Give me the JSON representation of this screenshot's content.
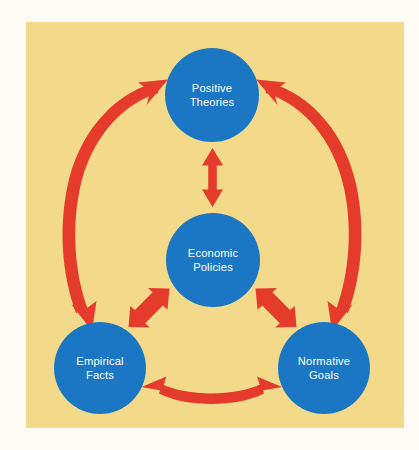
{
  "canvas": {
    "width": 419,
    "height": 450,
    "page_background": "#fdfbf3"
  },
  "panel": {
    "name": "yellow-board",
    "x": 26,
    "y": 22,
    "width": 378,
    "height": 406,
    "color": "#f3da8a"
  },
  "palette": {
    "node_fill": "#1b76c4",
    "node_text": "#ffffff",
    "arrow_fill": "#e53b2c",
    "panel_fill": "#f3da8a",
    "page_fill": "#fdfbf3"
  },
  "diagram": {
    "type": "cycle-diagram",
    "title": "",
    "nodes": [
      {
        "id": "positive-theories",
        "label_line1": "Positive",
        "label_line2": "Theories",
        "cx": 212,
        "cy": 95,
        "r": 47,
        "position": "top"
      },
      {
        "id": "economic-policies",
        "label_line1": "Economic",
        "label_line2": "Policies",
        "cx": 213,
        "cy": 260,
        "r": 47,
        "position": "center"
      },
      {
        "id": "empirical-facts",
        "label_line1": "Empirical",
        "label_line2": "Facts",
        "cx": 100,
        "cy": 368,
        "r": 46,
        "position": "bottom-left"
      },
      {
        "id": "normative-goals",
        "label_line1": "Normative",
        "label_line2": "Goals",
        "cx": 324,
        "cy": 368,
        "r": 46,
        "position": "bottom-right"
      }
    ],
    "connectors": [
      {
        "id": "arc-theories-facts",
        "from": "positive-theories",
        "to": "empirical-facts",
        "style": "curved-double-headed",
        "weight": "thick",
        "side": "left-outer"
      },
      {
        "id": "arc-theories-goals",
        "from": "positive-theories",
        "to": "normative-goals",
        "style": "curved-double-headed",
        "weight": "thick",
        "side": "right-outer"
      },
      {
        "id": "arrow-theories-policies",
        "from": "positive-theories",
        "to": "economic-policies",
        "style": "straight-double-headed",
        "weight": "medium",
        "side": "vertical-center"
      },
      {
        "id": "arrow-policies-facts",
        "from": "economic-policies",
        "to": "empirical-facts",
        "style": "straight-double-headed",
        "weight": "medium",
        "side": "diagonal-lower-left"
      },
      {
        "id": "arrow-policies-goals",
        "from": "economic-policies",
        "to": "normative-goals",
        "style": "straight-double-headed",
        "weight": "medium",
        "side": "diagonal-lower-right"
      },
      {
        "id": "arc-facts-goals",
        "from": "empirical-facts",
        "to": "normative-goals",
        "style": "curved-double-headed",
        "weight": "medium",
        "side": "bottom"
      }
    ]
  }
}
